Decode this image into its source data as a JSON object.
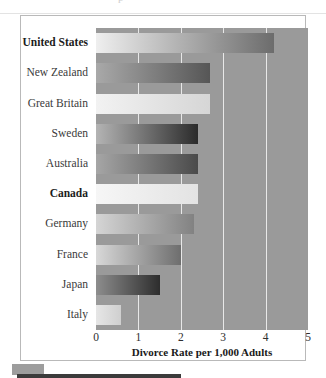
{
  "figure": {
    "top_ghost_text": "p",
    "footer_swatch_color": "#9d9d9d",
    "footer_rule_color": "#3b3b3b",
    "plot_background": "#9a9a9a",
    "gridline_color": "#e8e8e8",
    "frame_color": "#b9b9b9"
  },
  "chart_data": {
    "type": "bar",
    "orientation": "horizontal",
    "title": "",
    "subtitle": "",
    "xlabel": "Divorce Rate per 1,000 Adults",
    "ylabel": "",
    "xlim": [
      0,
      5
    ],
    "xticks": [
      0,
      1,
      2,
      3,
      4,
      5
    ],
    "xtick_labels": [
      "0",
      "1",
      "2",
      "3",
      "4",
      "5"
    ],
    "grid": true,
    "grid_axis": "x",
    "legend": false,
    "legend_position": "none",
    "categories": [
      "United States",
      "New Zealand",
      "Great Britain",
      "Sweden",
      "Australia",
      "Canada",
      "Germany",
      "France",
      "Japan",
      "Italy"
    ],
    "values": [
      4.2,
      2.7,
      2.7,
      2.4,
      2.4,
      2.4,
      2.3,
      2.0,
      1.5,
      0.6
    ],
    "emphasized_categories": [
      "United States",
      "Canada"
    ],
    "bar_gradients": [
      {
        "category": "United States",
        "from": "#efefef",
        "to": "#6c6c6c"
      },
      {
        "category": "New Zealand",
        "from": "#a9a9a9",
        "to": "#565656"
      },
      {
        "category": "Great Britain",
        "from": "#f2f2f2",
        "to": "#d6d6d6"
      },
      {
        "category": "Sweden",
        "from": "#b4b4b4",
        "to": "#2b2b2b"
      },
      {
        "category": "Australia",
        "from": "#a6a6a6",
        "to": "#4a4a4a"
      },
      {
        "category": "Canada",
        "from": "#f6f6f6",
        "to": "#e3e3e3"
      },
      {
        "category": "Germany",
        "from": "#d5d5d5",
        "to": "#828282"
      },
      {
        "category": "France",
        "from": "#d8d8d8",
        "to": "#6e6e6e"
      },
      {
        "category": "Japan",
        "from": "#8d8d8d",
        "to": "#2d2d2d"
      },
      {
        "category": "Italy",
        "from": "#e6e6e6",
        "to": "#cfcfcf"
      }
    ]
  }
}
